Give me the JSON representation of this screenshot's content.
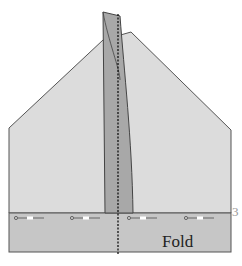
{
  "diagram": {
    "type": "paper-folding-instruction",
    "fold_label": "Fold",
    "step_number": "3",
    "colors": {
      "paper_light": "#dcdcdc",
      "paper_flap": "#a8a8a8",
      "band": "#c6c6c6",
      "outline": "#555555",
      "fold_line": "#111111"
    },
    "arrow_markers_count": 4
  }
}
